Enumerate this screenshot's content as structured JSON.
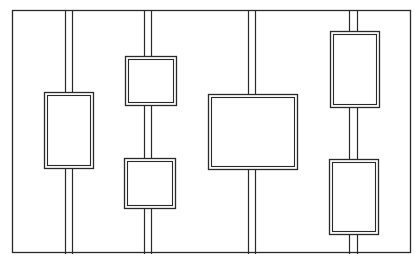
{
  "diagram": {
    "width": 420,
    "height": 263,
    "background": "#ffffff",
    "stroke": "#2a2a2a",
    "frame": {
      "x": 12,
      "y": 10,
      "w": 398,
      "h": 242
    },
    "bars": [
      {
        "id": "bar-1",
        "x1": 65,
        "x2": 72,
        "y_top": 10,
        "y_bottom": 254
      },
      {
        "id": "bar-2",
        "x1": 144,
        "x2": 151,
        "y_top": 10,
        "y_bottom": 254
      },
      {
        "id": "bar-3",
        "x1": 248,
        "x2": 255,
        "y_top": 10,
        "y_bottom": 254
      },
      {
        "id": "bar-4",
        "x1": 349,
        "x2": 357,
        "y_top": 10,
        "y_bottom": 254
      }
    ],
    "boxes": [
      {
        "id": "box-1",
        "bar": "bar-1",
        "x": 44,
        "y": 92,
        "w": 49,
        "h": 76
      },
      {
        "id": "box-2",
        "bar": "bar-2",
        "x": 125,
        "y": 56,
        "w": 51,
        "h": 49
      },
      {
        "id": "box-3",
        "bar": "bar-2",
        "x": 124,
        "y": 158,
        "w": 51,
        "h": 50
      },
      {
        "id": "box-4",
        "bar": "bar-3",
        "x": 208,
        "y": 94,
        "w": 89,
        "h": 75
      },
      {
        "id": "box-5",
        "bar": "bar-4",
        "x": 330,
        "y": 31,
        "w": 49,
        "h": 76
      },
      {
        "id": "box-6",
        "bar": "bar-4",
        "x": 329,
        "y": 159,
        "w": 49,
        "h": 75
      }
    ],
    "double_line_gap": 3
  }
}
